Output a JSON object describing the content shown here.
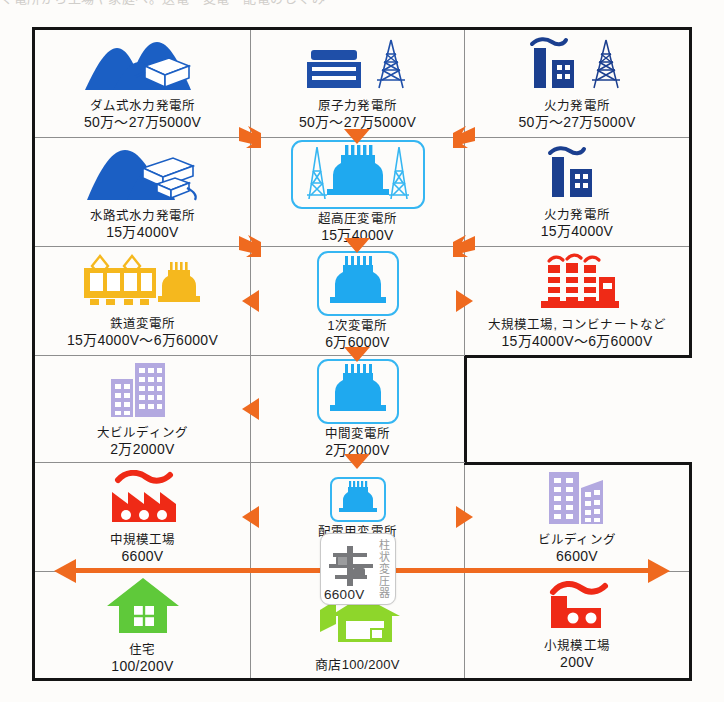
{
  "scan_sliver_text": "ぐ電所から工場や家庭へ。送電・変電・配電のしくみ",
  "colors": {
    "arrow_orange": "#ef6a1f",
    "hydro_blue": "#1b5fc4",
    "nuclear_blue": "#1f4fa8",
    "thermal_navy": "#1b3f8f",
    "substation_cyan": "#35b6f2",
    "rail_yellow": "#f5b81e",
    "factory_red": "#ef2a16",
    "building_purple": "#b3a9e0",
    "house_green": "#5fc93a",
    "shop_green": "#8ed62b",
    "grid_line": "#8e8e8e",
    "frame": "#141414"
  },
  "grid": {
    "rows": 6,
    "cols": 3,
    "missing_cells": [
      "row4-col3"
    ]
  },
  "cells": [
    {
      "id": "dam-hydro",
      "row": 1,
      "col": 1,
      "icon": "dam-hydro-plant-icon",
      "name": "ダム式水力発電所",
      "voltage": "50万～27万5000V"
    },
    {
      "id": "nuclear",
      "row": 1,
      "col": 2,
      "icon": "nuclear-plant-icon",
      "name": "原子力発電所",
      "voltage": "50万～27万5000V"
    },
    {
      "id": "thermal-1",
      "row": 1,
      "col": 3,
      "icon": "thermal-plant-icon",
      "name": "火力発電所",
      "voltage": "50万～27万5000V"
    },
    {
      "id": "run-of-river-hydro",
      "row": 2,
      "col": 1,
      "icon": "run-of-river-hydro-icon",
      "name": "水路式水力発電所",
      "voltage": "15万4000V"
    },
    {
      "id": "ehv-substation",
      "row": 2,
      "col": 2,
      "icon": "substation-transformer-icon",
      "boxed": true,
      "name": "超高圧変電所",
      "voltage": "15万4000V"
    },
    {
      "id": "thermal-2",
      "row": 2,
      "col": 3,
      "icon": "thermal-plant-small-icon",
      "name": "火力発電所",
      "voltage": "15万4000V"
    },
    {
      "id": "railway-substation",
      "row": 3,
      "col": 1,
      "icon": "railway-train-icon",
      "name": "鉄道変電所",
      "voltage": "15万4000V～6万6000V"
    },
    {
      "id": "primary-substation",
      "row": 3,
      "col": 2,
      "icon": "substation-transformer-icon",
      "boxed": true,
      "name": "1次変電所",
      "voltage": "6万6000V"
    },
    {
      "id": "large-factory",
      "row": 3,
      "col": 3,
      "icon": "large-factory-icon",
      "name": "大規模工場, コンビナートなど",
      "voltage": "15万4000V～6万6000V"
    },
    {
      "id": "large-building",
      "row": 4,
      "col": 1,
      "icon": "large-building-icon",
      "name": "大ビルディング",
      "voltage": "2万2000V"
    },
    {
      "id": "intermediate-substation",
      "row": 4,
      "col": 2,
      "icon": "substation-transformer-icon",
      "boxed": true,
      "name": "中間変電所",
      "voltage": "2万2000V"
    },
    {
      "id": "medium-factory",
      "row": 5,
      "col": 1,
      "icon": "medium-factory-icon",
      "name": "中規模工場",
      "voltage": "6600V"
    },
    {
      "id": "distribution-substation",
      "row": 5,
      "col": 2,
      "icon": "substation-transformer-small-icon",
      "boxed": true,
      "name": "配電用変電所",
      "voltage": "6600V"
    },
    {
      "id": "building",
      "row": 5,
      "col": 3,
      "icon": "building-icon",
      "name": "ビルディング",
      "voltage": "6600V"
    },
    {
      "id": "house",
      "row": 6,
      "col": 1,
      "icon": "house-icon",
      "name": "住宅",
      "voltage": "100/200V"
    },
    {
      "id": "shop",
      "row": 6,
      "col": 2,
      "icon": "shop-icon",
      "name_inline": "商店100/200V"
    },
    {
      "id": "small-factory",
      "row": 6,
      "col": 3,
      "icon": "small-factory-icon",
      "name": "小規模工場",
      "voltage": "200V"
    }
  ],
  "pole_transformer": {
    "label_vertical": "柱状変圧器",
    "voltage": "6600V",
    "icon": "pole-transformer-icon"
  }
}
